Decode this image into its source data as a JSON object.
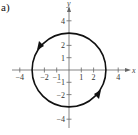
{
  "panel_label": "a)",
  "chart_data": {
    "type": "line",
    "title": "",
    "xlabel": "x",
    "ylabel": "y",
    "xlim": [
      -4.5,
      5
    ],
    "ylim": [
      -4.5,
      5
    ],
    "grid": false,
    "legend": null,
    "x_ticks": [
      -4,
      -2,
      -1,
      1,
      2,
      4
    ],
    "x_tick_labels": [
      "-4",
      "-2",
      "-1",
      "1",
      "2",
      "4"
    ],
    "y_ticks": [
      4,
      2,
      1,
      -1,
      -2,
      -4
    ],
    "y_tick_labels": [
      "4",
      "2",
      "1",
      "-1",
      "-2",
      "-4"
    ],
    "series": [
      {
        "name": "circle",
        "shape": "circle",
        "center": [
          0,
          0
        ],
        "radius": 3,
        "orientation": "counterclockwise",
        "arrows": [
          {
            "position": "upper-left",
            "direction": "down-left"
          },
          {
            "position": "lower-right",
            "direction": "up-right"
          }
        ]
      }
    ]
  },
  "colors": {
    "curve": "#111111",
    "axis": "#666666"
  }
}
